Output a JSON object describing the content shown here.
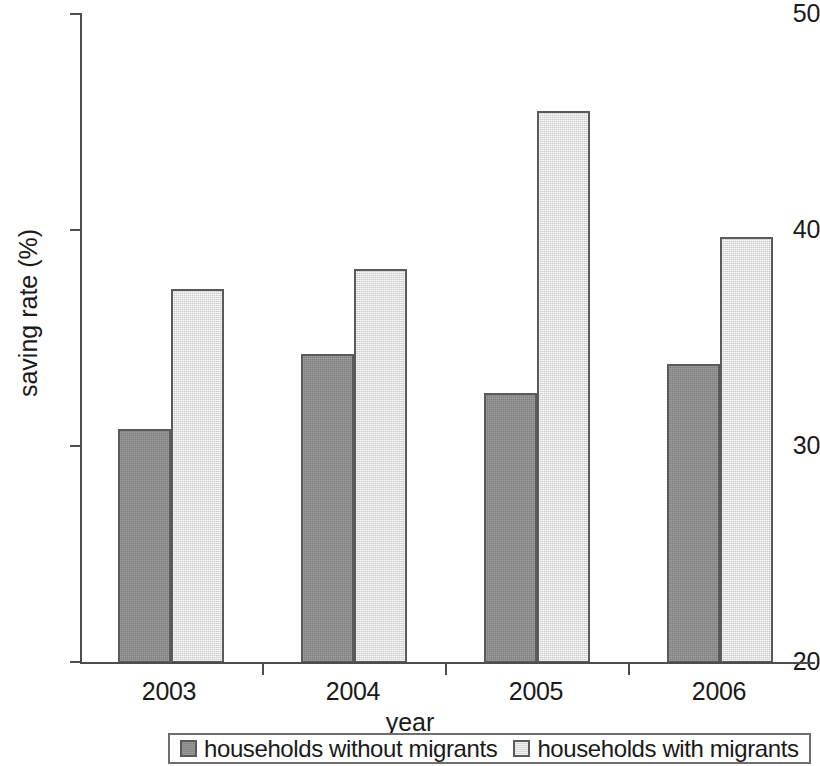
{
  "chart_data": {
    "type": "bar",
    "title": "",
    "subtitle": "",
    "xlabel": "year",
    "ylabel": "saving rate (%)",
    "categories": [
      "2003",
      "2004",
      "2005",
      "2006"
    ],
    "series": [
      {
        "name": "households without migrants",
        "color": "#8f8f8f",
        "values": [
          30.8,
          34.3,
          32.5,
          33.8
        ]
      },
      {
        "name": "households with migrants",
        "color": "#e3e3e3",
        "values": [
          37.3,
          38.2,
          45.5,
          39.7
        ]
      }
    ],
    "ylim": [
      20,
      50
    ],
    "ytick_labels": [
      "50",
      "40",
      "30",
      "20"
    ],
    "yticks": [
      50,
      40,
      30,
      20
    ],
    "grid": false,
    "legend_position": "bottom",
    "axis_color": "#4d4d4d",
    "bar_border_color": "#5a5a5a"
  },
  "legend": {
    "entries": [
      {
        "label": "households without migrants",
        "swatch": "dark-swatch-icon"
      },
      {
        "label": "households with migrants",
        "swatch": "light-swatch-icon"
      }
    ]
  }
}
